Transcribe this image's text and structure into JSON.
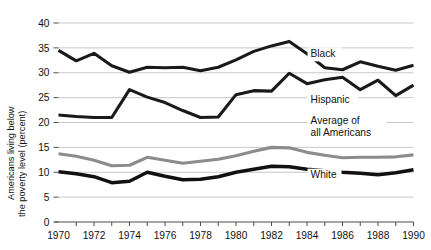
{
  "chart_data": {
    "type": "line",
    "title": "",
    "xlabel": "",
    "ylabel": "Americans living below the poverty level (percent)",
    "ylabel_line1": "Americans living below",
    "ylabel_line2": "the poverty level (percent)",
    "xlim": [
      1970,
      1990
    ],
    "ylim": [
      0,
      40
    ],
    "grid": true,
    "legend_position": "inline-right",
    "y_ticks": [
      0,
      5,
      10,
      15,
      20,
      25,
      30,
      35,
      40
    ],
    "y_tick_labels": [
      "0",
      "5",
      "10",
      "15",
      "20",
      "25",
      "30",
      "35",
      "40"
    ],
    "x_ticks": [
      1970,
      1971,
      1972,
      1973,
      1974,
      1975,
      1976,
      1977,
      1978,
      1979,
      1980,
      1981,
      1982,
      1983,
      1984,
      1985,
      1986,
      1987,
      1988,
      1989,
      1990
    ],
    "x_tick_labels": [
      "1970",
      "",
      "1972",
      "",
      "1974",
      "",
      "1976",
      "",
      "1978",
      "",
      "1980",
      "",
      "1982",
      "",
      "1984",
      "",
      "1986",
      "",
      "1988",
      "",
      "1990"
    ],
    "x_labeled_ticks": [
      1970,
      1972,
      1974,
      1976,
      1978,
      1980,
      1982,
      1984,
      1986,
      1988,
      1990
    ],
    "x": [
      1970,
      1971,
      1972,
      1973,
      1974,
      1975,
      1976,
      1977,
      1978,
      1979,
      1980,
      1981,
      1982,
      1983,
      1984,
      1985,
      1986,
      1987,
      1988,
      1989,
      1990
    ],
    "series": [
      {
        "name": "Black",
        "label": "Black",
        "color": "#1a1a1a",
        "width": 3.1,
        "label_x": 1984.2,
        "label_y": 33.2,
        "values": [
          34.5,
          32.4,
          33.9,
          31.4,
          30.1,
          31.1,
          31.0,
          31.1,
          30.4,
          31.1,
          32.6,
          34.3,
          35.4,
          36.3,
          33.8,
          31.0,
          30.6,
          32.2,
          31.3,
          30.5,
          31.5
        ]
      },
      {
        "name": "Hispanic",
        "label": "Hispanic",
        "color": "#1a1a1a",
        "width": 3.1,
        "label_x": 1984.2,
        "label_y": 23.9,
        "values": [
          21.5,
          21.2,
          21.0,
          21.0,
          26.6,
          25.1,
          24.0,
          22.4,
          21.0,
          21.1,
          25.6,
          26.4,
          26.3,
          29.9,
          27.8,
          28.6,
          29.1,
          26.6,
          28.5,
          25.4,
          27.5
        ]
      },
      {
        "name": "Average of all Americans",
        "label": "Average of",
        "label2": "all Americans",
        "color": "#8c8c8c",
        "width": 3.1,
        "label_x": 1984.2,
        "label_y": 19.6,
        "values": [
          13.7,
          13.2,
          12.4,
          11.3,
          11.4,
          13.0,
          12.4,
          11.8,
          12.2,
          12.6,
          13.3,
          14.2,
          15.0,
          14.9,
          14.0,
          13.4,
          12.9,
          13.0,
          13.0,
          13.1,
          13.5
        ]
      },
      {
        "name": "White",
        "label": "White",
        "color": "#111111",
        "width": 3.4,
        "label_x": 1984.2,
        "label_y": 8.8,
        "values": [
          10.1,
          9.7,
          9.1,
          7.9,
          8.2,
          10.0,
          9.2,
          8.5,
          8.6,
          9.1,
          10.0,
          10.6,
          11.2,
          11.1,
          10.6,
          10.3,
          10.0,
          9.8,
          9.5,
          9.9,
          10.5
        ]
      }
    ]
  },
  "axis": {
    "y_title_line1": "Americans living below",
    "y_title_line2": "the poverty level (percent)"
  }
}
